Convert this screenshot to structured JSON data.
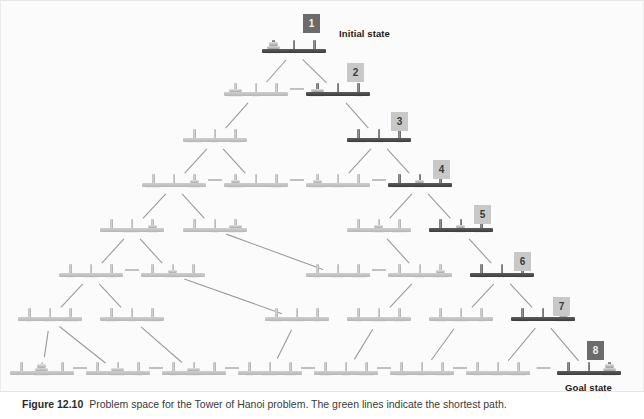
{
  "figure": {
    "caption_label": "Figure 12.10",
    "caption_text": "Problem space for the Tower of Hanoi problem. The green lines indicate the shortest path."
  },
  "labels": {
    "initial_state": "Initial state",
    "goal_state": "Goal state"
  },
  "badges": [
    {
      "id": "1",
      "text": "1",
      "style": "dark",
      "x": 310,
      "y": 22
    },
    {
      "id": "2",
      "text": "2",
      "style": "light",
      "x": 354,
      "y": 71
    },
    {
      "id": "3",
      "text": "3",
      "style": "light",
      "x": 398,
      "y": 120
    },
    {
      "id": "4",
      "text": "4",
      "style": "light",
      "x": 440,
      "y": 168
    },
    {
      "id": "5",
      "text": "5",
      "style": "light",
      "x": 481,
      "y": 213
    },
    {
      "id": "6",
      "text": "6",
      "style": "light",
      "x": 521,
      "y": 260
    },
    {
      "id": "7",
      "text": "7",
      "style": "light",
      "x": 560,
      "y": 305
    },
    {
      "id": "8",
      "text": "8",
      "style": "dark",
      "x": 594,
      "y": 349
    }
  ],
  "diagram": {
    "type": "state-space-tree",
    "disk_count": 3,
    "peg_count": 3,
    "level_count": 5,
    "state_count": 27,
    "states": [
      {
        "id": "s1",
        "level": 0,
        "x": 293,
        "y": 50,
        "pegs": [
          [
            3,
            2,
            1
          ],
          [],
          []
        ],
        "highlight": true,
        "path_index": 1
      },
      {
        "id": "s2",
        "level": 1,
        "x": 255,
        "y": 93,
        "pegs": [
          [
            3,
            2
          ],
          [
            1
          ],
          []
        ],
        "highlight": false,
        "path_index": null
      },
      {
        "id": "s3",
        "level": 1,
        "x": 337,
        "y": 93,
        "pegs": [
          [
            3,
            2
          ],
          [],
          [
            1
          ]
        ],
        "highlight": true,
        "path_index": 2
      },
      {
        "id": "s4",
        "level": 2,
        "x": 214,
        "y": 139,
        "pegs": [
          [
            3
          ],
          [
            1
          ],
          [
            2
          ]
        ],
        "highlight": false,
        "path_index": null
      },
      {
        "id": "s5",
        "level": 2,
        "x": 378,
        "y": 139,
        "pegs": [
          [
            3
          ],
          [
            2
          ],
          [
            1
          ]
        ],
        "highlight": true,
        "path_index": 3
      },
      {
        "id": "s6",
        "level": 3,
        "x": 173,
        "y": 184,
        "pegs": [
          [
            3
          ],
          [],
          [
            2,
            1
          ]
        ],
        "highlight": false,
        "path_index": null
      },
      {
        "id": "s7",
        "level": 3,
        "x": 255,
        "y": 184,
        "pegs": [
          [
            3,
            1
          ],
          [],
          [
            2
          ]
        ],
        "highlight": false,
        "path_index": null
      },
      {
        "id": "s8",
        "level": 3,
        "x": 337,
        "y": 184,
        "pegs": [
          [
            3,
            1
          ],
          [
            2
          ],
          []
        ],
        "highlight": false,
        "path_index": null
      },
      {
        "id": "s9",
        "level": 3,
        "x": 419,
        "y": 184,
        "pegs": [
          [
            3
          ],
          [
            2,
            1
          ],
          []
        ],
        "highlight": true,
        "path_index": 4
      },
      {
        "id": "s10",
        "level": 4,
        "x": 131,
        "y": 229,
        "pegs": [
          [],
          [
            3
          ],
          [
            2,
            1
          ]
        ],
        "highlight": false,
        "path_index": null
      },
      {
        "id": "s11",
        "level": 4,
        "x": 214,
        "y": 229,
        "pegs": [
          [],
          [
            1
          ],
          [
            3,
            2
          ]
        ],
        "highlight": false,
        "path_index": null
      },
      {
        "id": "s12",
        "level": 4,
        "x": 378,
        "y": 229,
        "pegs": [
          [],
          [
            2,
            1
          ],
          [
            3
          ]
        ],
        "highlight": false,
        "path_index": null
      },
      {
        "id": "s13",
        "level": 4,
        "x": 460,
        "y": 229,
        "pegs": [
          [],
          [
            2,
            1
          ],
          [
            3
          ]
        ],
        "highlight": true,
        "path_index": 5
      },
      {
        "id": "s14",
        "level": 5,
        "x": 90,
        "y": 274,
        "pegs": [
          [
            1
          ],
          [
            3
          ],
          [
            2
          ]
        ],
        "highlight": false,
        "path_index": null
      },
      {
        "id": "s15",
        "level": 5,
        "x": 172,
        "y": 274,
        "pegs": [
          [],
          [
            3,
            1
          ],
          [
            2
          ]
        ],
        "highlight": false,
        "path_index": null
      },
      {
        "id": "s16",
        "level": 5,
        "x": 337,
        "y": 274,
        "pegs": [
          [
            1
          ],
          [
            2
          ],
          [
            3
          ]
        ],
        "highlight": false,
        "path_index": null
      },
      {
        "id": "s17",
        "level": 5,
        "x": 419,
        "y": 274,
        "pegs": [
          [],
          [
            2
          ],
          [
            3,
            1
          ]
        ],
        "highlight": false,
        "path_index": null
      },
      {
        "id": "s18",
        "level": 5,
        "x": 501,
        "y": 274,
        "pegs": [
          [
            2
          ],
          [
            1
          ],
          [
            3
          ]
        ],
        "highlight": true,
        "path_index": 6
      },
      {
        "id": "s19",
        "level": 6,
        "x": 49,
        "y": 318,
        "pegs": [
          [
            1
          ],
          [
            2
          ],
          [
            3
          ]
        ],
        "highlight": false,
        "path_index": null
      },
      {
        "id": "s20",
        "level": 6,
        "x": 131,
        "y": 318,
        "pegs": [
          [
            2
          ],
          [
            1
          ],
          [
            3
          ]
        ],
        "highlight": false,
        "path_index": null
      },
      {
        "id": "s21",
        "level": 6,
        "x": 296,
        "y": 318,
        "pegs": [
          [
            2
          ],
          [
            3
          ],
          [
            1
          ]
        ],
        "highlight": false,
        "path_index": null
      },
      {
        "id": "s22",
        "level": 6,
        "x": 378,
        "y": 318,
        "pegs": [
          [
            1
          ],
          [
            3
          ],
          [
            2
          ]
        ],
        "highlight": false,
        "path_index": null
      },
      {
        "id": "s23",
        "level": 6,
        "x": 460,
        "y": 318,
        "pegs": [
          [
            2
          ],
          [
            3
          ],
          [
            1
          ]
        ],
        "highlight": false,
        "path_index": null
      },
      {
        "id": "s24",
        "level": 6,
        "x": 542,
        "y": 318,
        "pegs": [
          [
            2
          ],
          [],
          [
            3,
            1
          ]
        ],
        "highlight": true,
        "path_index": 7
      },
      {
        "id": "s25",
        "level": 7,
        "x": 41,
        "y": 372,
        "pegs": [
          [],
          [
            3,
            2,
            1
          ],
          []
        ],
        "highlight": false,
        "path_index": null
      },
      {
        "id": "s26",
        "level": 7,
        "x": 117,
        "y": 372,
        "pegs": [
          [],
          [
            3,
            2
          ],
          [
            1
          ]
        ],
        "highlight": false,
        "path_index": null
      },
      {
        "id": "s27",
        "level": 7,
        "x": 193,
        "y": 372,
        "pegs": [
          [
            1
          ],
          [
            3,
            2
          ],
          []
        ],
        "highlight": false,
        "path_index": null
      },
      {
        "id": "s28",
        "level": 7,
        "x": 269,
        "y": 372,
        "pegs": [
          [
            1
          ],
          [
            3
          ],
          [
            2
          ]
        ],
        "highlight": false,
        "path_index": null
      },
      {
        "id": "s29",
        "level": 7,
        "x": 345,
        "y": 372,
        "pegs": [
          [
            2
          ],
          [
            1
          ],
          [
            3
          ]
        ],
        "highlight": false,
        "path_index": null
      },
      {
        "id": "s30",
        "level": 7,
        "x": 421,
        "y": 372,
        "pegs": [
          [
            2
          ],
          [
            1
          ],
          [
            3
          ]
        ],
        "highlight": false,
        "path_index": null
      },
      {
        "id": "s31",
        "level": 7,
        "x": 497,
        "y": 372,
        "pegs": [
          [
            1
          ],
          [
            2
          ],
          [
            3
          ]
        ],
        "highlight": false,
        "path_index": null
      },
      {
        "id": "s32",
        "level": 7,
        "x": 588,
        "y": 372,
        "pegs": [
          [],
          [],
          [
            3,
            2,
            1
          ]
        ],
        "highlight": true,
        "path_index": 8
      }
    ],
    "edges": [
      {
        "from": "s1",
        "to": "s2",
        "kind": "diagonal"
      },
      {
        "from": "s1",
        "to": "s3",
        "kind": "diagonal"
      },
      {
        "from": "s2",
        "to": "s3",
        "kind": "horizontal"
      },
      {
        "from": "s2",
        "to": "s4",
        "kind": "diagonal"
      },
      {
        "from": "s3",
        "to": "s5",
        "kind": "diagonal"
      },
      {
        "from": "s4",
        "to": "s6",
        "kind": "diagonal"
      },
      {
        "from": "s4",
        "to": "s7",
        "kind": "diagonal"
      },
      {
        "from": "s5",
        "to": "s8",
        "kind": "diagonal"
      },
      {
        "from": "s5",
        "to": "s9",
        "kind": "diagonal"
      },
      {
        "from": "s6",
        "to": "s7",
        "kind": "horizontal"
      },
      {
        "from": "s7",
        "to": "s8",
        "kind": "horizontal"
      },
      {
        "from": "s8",
        "to": "s9",
        "kind": "horizontal"
      },
      {
        "from": "s6",
        "to": "s10",
        "kind": "diagonal"
      },
      {
        "from": "s6",
        "to": "s11",
        "kind": "diagonal"
      },
      {
        "from": "s9",
        "to": "s12",
        "kind": "diagonal"
      },
      {
        "from": "s9",
        "to": "s13",
        "kind": "diagonal"
      },
      {
        "from": "s10",
        "to": "s14",
        "kind": "diagonal"
      },
      {
        "from": "s10",
        "to": "s15",
        "kind": "diagonal"
      },
      {
        "from": "s11",
        "to": "s16",
        "kind": "diagonal"
      },
      {
        "from": "s12",
        "to": "s17",
        "kind": "diagonal"
      },
      {
        "from": "s13",
        "to": "s18",
        "kind": "diagonal"
      },
      {
        "from": "s14",
        "to": "s15",
        "kind": "horizontal"
      },
      {
        "from": "s16",
        "to": "s17",
        "kind": "horizontal"
      },
      {
        "from": "s14",
        "to": "s19",
        "kind": "diagonal"
      },
      {
        "from": "s14",
        "to": "s20",
        "kind": "diagonal"
      },
      {
        "from": "s15",
        "to": "s21",
        "kind": "diagonal"
      },
      {
        "from": "s17",
        "to": "s22",
        "kind": "diagonal"
      },
      {
        "from": "s18",
        "to": "s23",
        "kind": "diagonal"
      },
      {
        "from": "s18",
        "to": "s24",
        "kind": "diagonal"
      },
      {
        "from": "s19",
        "to": "s25",
        "kind": "diagonal"
      },
      {
        "from": "s19",
        "to": "s26",
        "kind": "diagonal"
      },
      {
        "from": "s20",
        "to": "s27",
        "kind": "diagonal"
      },
      {
        "from": "s21",
        "to": "s28",
        "kind": "diagonal"
      },
      {
        "from": "s22",
        "to": "s29",
        "kind": "diagonal"
      },
      {
        "from": "s23",
        "to": "s30",
        "kind": "diagonal"
      },
      {
        "from": "s24",
        "to": "s31",
        "kind": "diagonal"
      },
      {
        "from": "s24",
        "to": "s32",
        "kind": "diagonal"
      },
      {
        "from": "s25",
        "to": "s26",
        "kind": "horizontal"
      },
      {
        "from": "s26",
        "to": "s27",
        "kind": "horizontal"
      },
      {
        "from": "s27",
        "to": "s28",
        "kind": "horizontal"
      },
      {
        "from": "s28",
        "to": "s29",
        "kind": "horizontal"
      },
      {
        "from": "s29",
        "to": "s30",
        "kind": "horizontal"
      },
      {
        "from": "s30",
        "to": "s31",
        "kind": "horizontal"
      },
      {
        "from": "s31",
        "to": "s32",
        "kind": "horizontal"
      }
    ]
  },
  "colors": {
    "background": "#fbfbfb",
    "edge": "#9a9a9a",
    "badge_dark": "#6b6b6b",
    "badge_light": "#c8c8c8",
    "state_base": "#c0c0c0",
    "state_base_highlight": "#4a4a4a",
    "caption_text": "#3a3a3a"
  },
  "label_positions": {
    "initial_state": {
      "x": 338,
      "y": 27
    },
    "goal_state": {
      "x": 564,
      "y": 381
    }
  }
}
